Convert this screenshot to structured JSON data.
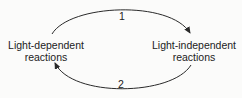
{
  "diagram": {
    "type": "cycle",
    "nodes": [
      {
        "id": "left",
        "line1": "Light-dependent",
        "line2": "reactions"
      },
      {
        "id": "right",
        "line1": "Light-independent",
        "line2": "reactions"
      }
    ],
    "edges": [
      {
        "from": "left",
        "to": "right",
        "label": "1",
        "position": "top"
      },
      {
        "from": "right",
        "to": "left",
        "label": "2",
        "position": "bottom"
      }
    ],
    "colors": {
      "line": "#2a2a2a",
      "text": "#222222",
      "background": "#fbfbfa"
    }
  }
}
